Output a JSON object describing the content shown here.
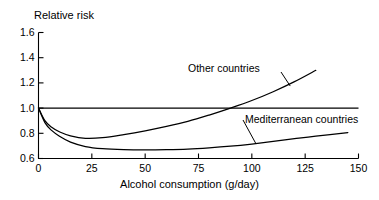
{
  "chart_data": {
    "type": "line",
    "title": "",
    "xlabel": "Alcohol consumption (g/day)",
    "ylabel": "Relative risk",
    "xlim": [
      0,
      150
    ],
    "ylim": [
      0.6,
      1.6
    ],
    "xticks": [
      "0",
      "25",
      "50",
      "75",
      "100",
      "125",
      "150"
    ],
    "xtick_values": [
      0,
      25,
      50,
      75,
      100,
      125,
      150
    ],
    "yticks": [
      "0.6",
      "0.8",
      "1.0",
      "1.2",
      "1.4",
      "1.6"
    ],
    "ytick_values": [
      0.6,
      0.8,
      1.0,
      1.2,
      1.4,
      1.6
    ],
    "grid": false,
    "legend": "inline-curve-labels",
    "line_color": "#000000",
    "background_color": "#ffffff",
    "reference_line": {
      "name": "Relative risk = 1.0",
      "orientation": "horizontal",
      "value": 1.0,
      "x_from": 0,
      "x_to": 150
    },
    "series": [
      {
        "name": "Other countries",
        "label": "Other countries",
        "x": [
          0,
          3,
          6,
          10,
          15,
          22,
          30,
          40,
          50,
          60,
          70,
          80,
          90,
          100,
          110,
          120,
          130
        ],
        "values": [
          1.0,
          0.9,
          0.85,
          0.81,
          0.78,
          0.76,
          0.765,
          0.79,
          0.82,
          0.855,
          0.895,
          0.945,
          1.0,
          1.06,
          1.13,
          1.21,
          1.3
        ]
      },
      {
        "name": "Mediterranean countries",
        "label": "Mediterranean countries",
        "x": [
          0,
          3,
          6,
          10,
          15,
          22,
          30,
          40,
          50,
          60,
          70,
          80,
          90,
          100,
          110,
          120,
          130,
          145
        ],
        "values": [
          1.0,
          0.885,
          0.825,
          0.775,
          0.73,
          0.695,
          0.678,
          0.67,
          0.668,
          0.67,
          0.675,
          0.685,
          0.698,
          0.715,
          0.735,
          0.757,
          0.778,
          0.805
        ]
      }
    ]
  },
  "axis_labels": {
    "y_axis_title": "Relative risk",
    "x_axis_title": "Alcohol consumption (g/day)"
  }
}
